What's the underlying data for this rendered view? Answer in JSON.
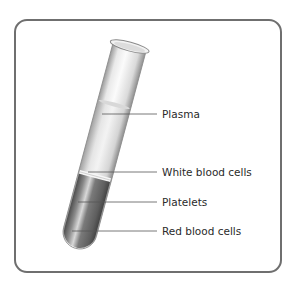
{
  "diagram": {
    "title": "",
    "colors": {
      "frame_border": "#6f6f6f",
      "label_text": "#2a2a2a",
      "leader_line": "#555555",
      "plasma": "#e6e6e6",
      "white_band": "#f6f6f6",
      "red_cells": "#6d6d6d"
    },
    "labels": [
      {
        "id": "plasma",
        "text": "Plasma"
      },
      {
        "id": "white-blood-cells",
        "text": "White blood cells"
      },
      {
        "id": "platelets",
        "text": "Platelets"
      },
      {
        "id": "red-blood-cells",
        "text": "Red blood cells"
      }
    ]
  }
}
